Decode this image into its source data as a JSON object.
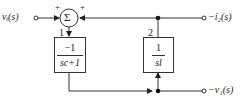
{
  "diagram": {
    "type": "block-diagram",
    "input": {
      "label": "vᵢ(s)"
    },
    "summing_junction": {
      "symbol": "Σ",
      "signs": [
        "+",
        "+"
      ]
    },
    "block1": {
      "index": "1",
      "numerator": "−1",
      "denominator": "sc+1"
    },
    "block2": {
      "index": "2",
      "numerator": "1",
      "denominator": "sl"
    },
    "outputs": {
      "top": {
        "label": "−i₂(s)"
      },
      "bottom": {
        "label": "−v₁(s)"
      }
    },
    "colors": {
      "line": "#333333",
      "background": "#ffffff"
    }
  }
}
